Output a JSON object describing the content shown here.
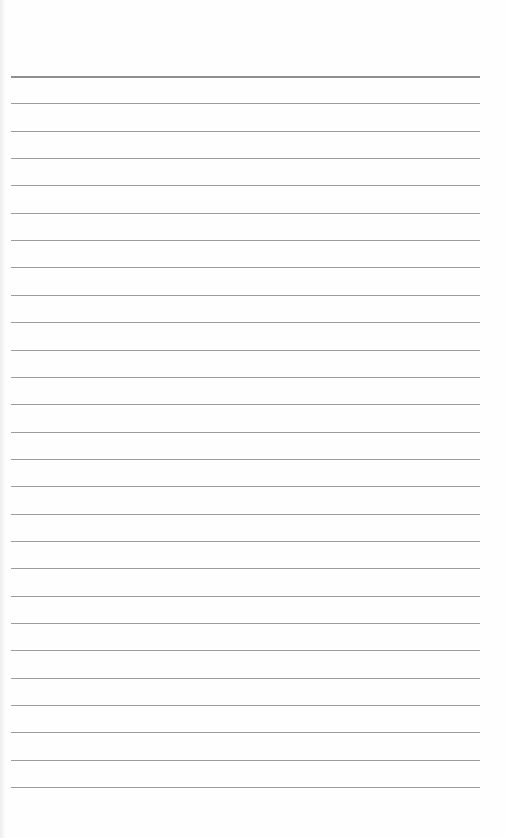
{
  "page": {
    "type": "lined-paper",
    "background_color": "#fefefe",
    "line_color": "#9c9c9c",
    "line_count": 27,
    "first_line_y": 76,
    "line_spacing": 27.35,
    "line_left": 11,
    "line_right": 480
  }
}
